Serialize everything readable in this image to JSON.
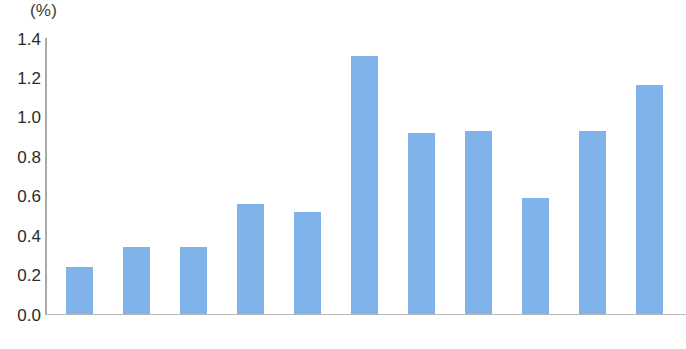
{
  "chart_data": {
    "type": "bar",
    "title": "",
    "subtitle": "",
    "xlabel": "",
    "ylabel": "",
    "unit_label": "(%)",
    "categories": [
      "2006",
      "2007",
      "2008",
      "2009",
      "2010",
      "2011",
      "2012",
      "2013",
      "2014",
      "2015",
      "2016"
    ],
    "values": [
      0.24,
      0.34,
      0.34,
      0.56,
      0.52,
      1.31,
      0.92,
      0.93,
      0.59,
      0.93,
      1.16
    ],
    "series": [
      {
        "name": "",
        "values": [
          0.24,
          0.34,
          0.34,
          0.56,
          0.52,
          1.31,
          0.92,
          0.93,
          0.59,
          0.93,
          1.16
        ]
      }
    ],
    "ylim": [
      0.0,
      1.4
    ],
    "ytick_labels": [
      "1.4",
      "1.2",
      "1.0",
      "0.8",
      "0.6",
      "0.4",
      "0.2",
      "0.0"
    ],
    "ytick_values": [
      1.4,
      1.2,
      1.0,
      0.8,
      0.6,
      0.4,
      0.2,
      0.0
    ],
    "grid": false,
    "legend": null,
    "legend_position": "none",
    "bar_color": "#7fb3ea",
    "axis_color": "#a9a9a9",
    "background_color": "#ffffff",
    "text_color": "#2b2b2b",
    "annotations": []
  }
}
